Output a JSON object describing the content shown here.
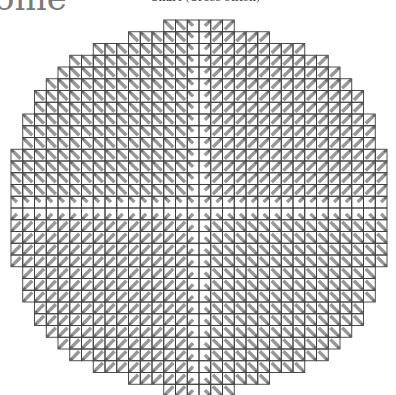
{
  "header": {
    "title_fragment": "ome",
    "caption_fragment": "Chart (Cross-stitch)"
  },
  "diagram": {
    "type": "cross-stitch-chart",
    "shape": "circle",
    "grid": {
      "origin_x": 11,
      "origin_y": 20,
      "cell_size": 11.75,
      "columns": 32,
      "rows": 32
    },
    "colors": {
      "grid_line": "#3a3a3a",
      "stitch": "#8c8c8c",
      "stitch_end": "#555555",
      "background": "#ffffff"
    },
    "quadrant_stitch_direction": {
      "top_left": "backslash",
      "top_right": "slash",
      "bottom_left": "slash",
      "bottom_right": "backslash"
    },
    "center_gap": "white cross along center row and column",
    "row_half_widths": [
      3,
      6,
      9,
      11,
      12,
      13,
      14,
      14,
      15,
      15,
      15,
      16,
      16,
      16,
      16,
      16,
      16,
      16,
      16,
      16,
      16,
      15,
      15,
      15,
      14,
      14,
      13,
      12,
      11,
      9,
      6,
      3
    ]
  }
}
